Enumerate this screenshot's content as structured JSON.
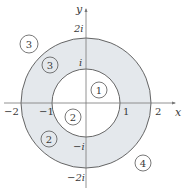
{
  "figure": {
    "type": "complex-plane-annulus",
    "axes": {
      "x_label": "x",
      "y_label": "y",
      "x_ticks": [
        "−2",
        "−1",
        "1",
        "2"
      ],
      "y_ticks": [
        "2i",
        "i",
        "−i",
        "−2i"
      ]
    },
    "circles": [
      {
        "name": "inner-circle",
        "radius": 1
      },
      {
        "name": "outer-circle",
        "radius": 2
      }
    ],
    "region_labels": [
      {
        "id": "r1",
        "text": "1",
        "location": "inside inner circle, upper right"
      },
      {
        "id": "r2a",
        "text": "2",
        "location": "inside inner circle, lower left"
      },
      {
        "id": "r2b",
        "text": "2",
        "location": "shaded annulus, lower left"
      },
      {
        "id": "r3a",
        "text": "3",
        "location": "shaded annulus, upper left"
      },
      {
        "id": "r3b",
        "text": "3",
        "location": "outside outer circle, upper left"
      },
      {
        "id": "r4",
        "text": "4",
        "location": "outside outer circle, lower right"
      }
    ],
    "colors": {
      "annulus_fill": "#e4e8ec",
      "stroke": "#555555",
      "background": "#ffffff"
    }
  }
}
